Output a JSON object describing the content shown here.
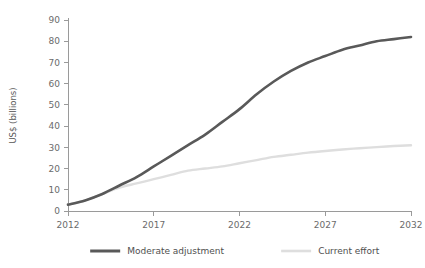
{
  "chart_data": {
    "type": "line",
    "title": "",
    "xlabel": "",
    "ylabel": "US$ (billions)",
    "xlim": [
      2012,
      2032
    ],
    "ylim": [
      0,
      90
    ],
    "grid": false,
    "legend_position": "bottom",
    "x_ticks": [
      "2012",
      "2017",
      "2022",
      "2027",
      "2032"
    ],
    "x_tick_values": [
      2012,
      2017,
      2022,
      2027,
      2032
    ],
    "y_ticks": [
      "0",
      "10",
      "20",
      "30",
      "40",
      "50",
      "60",
      "70",
      "80",
      "90"
    ],
    "y_tick_values": [
      0,
      10,
      20,
      30,
      40,
      50,
      60,
      70,
      80,
      90
    ],
    "x": [
      2012,
      2013,
      2014,
      2015,
      2016,
      2017,
      2018,
      2019,
      2020,
      2021,
      2022,
      2023,
      2024,
      2025,
      2026,
      2027,
      2028,
      2029,
      2030,
      2031,
      2032
    ],
    "series": [
      {
        "name": "Moderate adjustment",
        "color": "#595959",
        "values": [
          3,
          5,
          8,
          12,
          16,
          21,
          26,
          31,
          36,
          42,
          48,
          55,
          61,
          66,
          70,
          73,
          76,
          78,
          80,
          81,
          82
        ]
      },
      {
        "name": "Current effort",
        "color": "#dedede",
        "values": [
          3,
          5,
          8,
          11,
          13,
          15,
          17,
          19,
          20,
          21,
          22.5,
          24,
          25.5,
          26.5,
          27.5,
          28.3,
          29,
          29.6,
          30.1,
          30.6,
          31
        ]
      }
    ]
  },
  "legend": {
    "items": [
      {
        "label": "Moderate adjustment",
        "color": "#595959"
      },
      {
        "label": "Current effort",
        "color": "#dedede"
      }
    ]
  },
  "axes": {
    "y_axis_title": "US$ (billions)"
  }
}
